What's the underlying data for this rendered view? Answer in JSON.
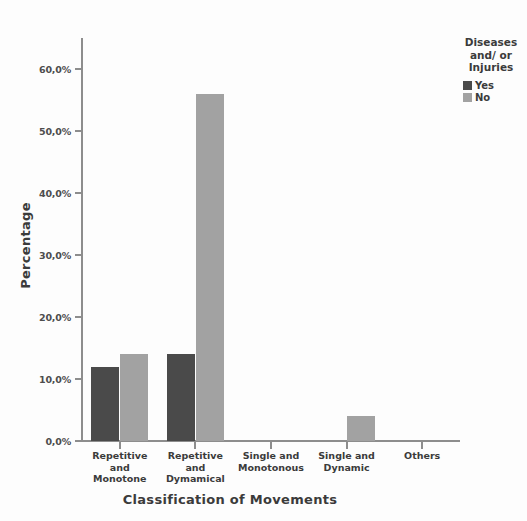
{
  "chart_data": {
    "type": "bar",
    "title": "",
    "xlabel": "Classification of Movements",
    "ylabel": "Percentage",
    "categories": [
      "Repetitive\nand\nMonotone",
      "Repetitive\nand\nDymamical",
      "Single and\nMonotonous",
      "Single and\nDynamic",
      "Others"
    ],
    "series": [
      {
        "name": "Yes",
        "color": "#4a4a4a",
        "values": [
          12,
          14,
          0,
          0,
          0
        ]
      },
      {
        "name": "No",
        "color": "#a2a2a2",
        "values": [
          14,
          56,
          0,
          4,
          0
        ]
      }
    ],
    "ylim": [
      0,
      65
    ],
    "ytick_values": [
      0,
      10,
      20,
      30,
      40,
      50,
      60
    ],
    "ytick_labels": [
      "0,0%",
      "10,0%",
      "20,0%",
      "30,0%",
      "40,0%",
      "50,0%",
      "60,0%"
    ],
    "grid": false,
    "legend_position": "right"
  },
  "legend": {
    "title": "Diseases\nand/ or\nInjuries",
    "entries": [
      {
        "label": "Yes",
        "color": "#4a4a4a"
      },
      {
        "label": "No",
        "color": "#a2a2a2"
      }
    ]
  },
  "axes": {
    "y_title": "Percentage",
    "x_title": "Classification of Movements"
  },
  "colors": {
    "background": "#fdfdfd",
    "axis": "#8d8d8d",
    "text": "#3b3b3b",
    "series_yes": "#4a4a4a",
    "series_no": "#a2a2a2"
  }
}
